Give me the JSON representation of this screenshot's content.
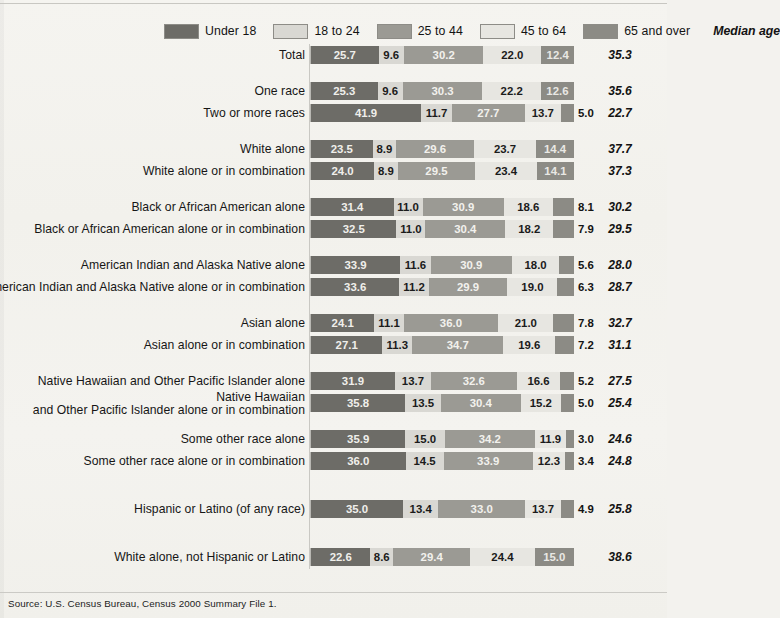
{
  "legend": {
    "items": [
      {
        "label": "Under 18",
        "color": "#6d6c67"
      },
      {
        "label": "18 to 24",
        "color": "#d9d8d3"
      },
      {
        "label": "25 to 44",
        "color": "#9b9a94"
      },
      {
        "label": "45 to 64",
        "color": "#e7e6e1"
      },
      {
        "label": "65 and over",
        "color": "#8c8b85"
      }
    ],
    "median_header": "Median age"
  },
  "source": "Source:  U.S. Census Bureau, Census 2000 Summary File 1.",
  "chart_data": {
    "type": "bar",
    "subtype": "stacked-horizontal-100-percent",
    "title": "",
    "xlabel": "Percent",
    "ylabel": "",
    "xlim": [
      0,
      100
    ],
    "grid": false,
    "legend_position": "top",
    "series": [
      {
        "name": "Under 18",
        "color": "#6d6c67"
      },
      {
        "name": "18 to 24",
        "color": "#d9d8d3"
      },
      {
        "name": "25 to 44",
        "color": "#9b9a94"
      },
      {
        "name": "45 to 64",
        "color": "#e7e6e1"
      },
      {
        "name": "65 and over",
        "color": "#8c8b85"
      }
    ],
    "annotation_column": {
      "name": "Median age"
    },
    "categories": [
      "Total",
      "One race",
      "Two or more races",
      "White alone",
      "White alone or in combination",
      "Black or African American alone",
      "Black or African American alone or in combination",
      "American Indian and Alaska Native alone",
      "American Indian and Alaska Native alone or in combination",
      "Asian alone",
      "Asian alone or in combination",
      "Native Hawaiian and Other Pacific Islander alone",
      "Native Hawaiian and Other Pacific Islander alone or in combination",
      "Some other race alone",
      "Some other race alone or in combination",
      "Hispanic or Latino (of any race)",
      "White alone, not Hispanic or Latino"
    ],
    "values": [
      [
        25.7,
        9.6,
        30.2,
        22.0,
        12.4
      ],
      [
        25.3,
        9.6,
        30.3,
        22.2,
        12.6
      ],
      [
        41.9,
        11.7,
        27.7,
        13.7,
        5.0
      ],
      [
        23.5,
        8.9,
        29.6,
        23.7,
        14.4
      ],
      [
        24.0,
        8.9,
        29.5,
        23.4,
        14.1
      ],
      [
        31.4,
        11.0,
        30.9,
        18.6,
        8.1
      ],
      [
        32.5,
        11.0,
        30.4,
        18.2,
        7.9
      ],
      [
        33.9,
        11.6,
        30.9,
        18.0,
        5.6
      ],
      [
        33.6,
        11.2,
        29.9,
        19.0,
        6.3
      ],
      [
        24.1,
        11.1,
        36.0,
        21.0,
        7.8
      ],
      [
        27.1,
        11.3,
        34.7,
        19.6,
        7.2
      ],
      [
        31.9,
        13.7,
        32.6,
        16.6,
        5.2
      ],
      [
        35.8,
        13.5,
        30.4,
        15.2,
        5.0
      ],
      [
        35.9,
        15.0,
        34.2,
        11.9,
        3.0
      ],
      [
        36.0,
        14.5,
        33.9,
        12.3,
        3.4
      ],
      [
        35.0,
        13.4,
        33.0,
        13.7,
        4.9
      ],
      [
        22.6,
        8.6,
        29.4,
        24.4,
        15.0
      ]
    ],
    "median_age": [
      35.3,
      35.6,
      22.7,
      37.7,
      37.3,
      30.2,
      29.5,
      28.0,
      28.7,
      32.7,
      31.1,
      27.5,
      25.4,
      24.6,
      24.8,
      25.8,
      38.6
    ]
  },
  "rows": [
    {
      "label": "Total",
      "label_lines": [
        "Total"
      ],
      "values": [
        25.7,
        9.6,
        30.2,
        22.0,
        12.4
      ],
      "median": "35.3",
      "gap_before": "none"
    },
    {
      "label": "One race",
      "label_lines": [
        "One race"
      ],
      "values": [
        25.3,
        9.6,
        30.3,
        22.2,
        12.6
      ],
      "median": "35.6",
      "gap_before": "lg"
    },
    {
      "label": "Two or more races",
      "label_lines": [
        "Two or more races"
      ],
      "values": [
        41.9,
        11.7,
        27.7,
        13.7,
        5.0
      ],
      "median": "22.7",
      "gap_before": "none"
    },
    {
      "label": "White alone",
      "label_lines": [
        "White alone"
      ],
      "values": [
        23.5,
        8.9,
        29.6,
        23.7,
        14.4
      ],
      "median": "37.7",
      "gap_before": "lg"
    },
    {
      "label": "White alone or in combination",
      "label_lines": [
        "White alone or in combination"
      ],
      "values": [
        24.0,
        8.9,
        29.5,
        23.4,
        14.1
      ],
      "median": "37.3",
      "gap_before": "none"
    },
    {
      "label": "Black or African American alone",
      "label_lines": [
        "Black or African American alone"
      ],
      "values": [
        31.4,
        11.0,
        30.9,
        18.6,
        8.1
      ],
      "median": "30.2",
      "gap_before": "lg"
    },
    {
      "label": "Black or African American alone or in combination",
      "label_lines": [
        "Black or African American alone or in combination"
      ],
      "values": [
        32.5,
        11.0,
        30.4,
        18.2,
        7.9
      ],
      "median": "29.5",
      "gap_before": "none"
    },
    {
      "label": "American Indian and Alaska Native alone",
      "label_lines": [
        "American Indian and Alaska Native alone"
      ],
      "values": [
        33.9,
        11.6,
        30.9,
        18.0,
        5.6
      ],
      "median": "28.0",
      "gap_before": "lg"
    },
    {
      "label": "American Indian and Alaska Native alone or in combination",
      "label_lines": [
        "American Indian and Alaska Native alone or in combination"
      ],
      "values": [
        33.6,
        11.2,
        29.9,
        19.0,
        6.3
      ],
      "median": "28.7",
      "gap_before": "none"
    },
    {
      "label": "Asian alone",
      "label_lines": [
        "Asian alone"
      ],
      "values": [
        24.1,
        11.1,
        36.0,
        21.0,
        7.8
      ],
      "median": "32.7",
      "gap_before": "lg"
    },
    {
      "label": "Asian alone or in combination",
      "label_lines": [
        "Asian alone or in combination"
      ],
      "values": [
        27.1,
        11.3,
        34.7,
        19.6,
        7.2
      ],
      "median": "31.1",
      "gap_before": "none"
    },
    {
      "label": "Native Hawaiian and Other Pacific Islander alone",
      "label_lines": [
        "Native Hawaiian and Other Pacific Islander alone"
      ],
      "values": [
        31.9,
        13.7,
        32.6,
        16.6,
        5.2
      ],
      "median": "27.5",
      "gap_before": "lg"
    },
    {
      "label": "Native Hawaiian and Other Pacific Islander alone or in combination",
      "label_lines": [
        "Native Hawaiian",
        "and Other Pacific Islander alone or in combination"
      ],
      "values": [
        35.8,
        13.5,
        30.4,
        15.2,
        5.0
      ],
      "median": "25.4",
      "gap_before": "none"
    },
    {
      "label": "Some other race alone",
      "label_lines": [
        "Some other race alone"
      ],
      "values": [
        35.9,
        15.0,
        34.2,
        11.9,
        3.0
      ],
      "median": "24.6",
      "gap_before": "lg"
    },
    {
      "label": "Some other race alone or in combination",
      "label_lines": [
        "Some other race alone or in combination"
      ],
      "values": [
        36.0,
        14.5,
        33.9,
        12.3,
        3.4
      ],
      "median": "24.8",
      "gap_before": "none"
    },
    {
      "label": "Hispanic or Latino (of any race)",
      "label_lines": [
        "Hispanic or Latino (of any race)"
      ],
      "values": [
        35.0,
        13.4,
        33.0,
        13.7,
        4.9
      ],
      "median": "25.8",
      "gap_before": "xl"
    },
    {
      "label": "White alone, not Hispanic or Latino",
      "label_lines": [
        "White alone, not Hispanic or Latino"
      ],
      "values": [
        22.6,
        8.6,
        29.4,
        24.4,
        15.0
      ],
      "median": "38.6",
      "gap_before": "xl"
    }
  ]
}
